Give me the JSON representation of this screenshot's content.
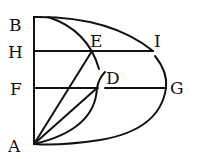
{
  "diagram": {
    "labels": {
      "B": "B",
      "H": "H",
      "F": "F",
      "A": "A",
      "E": "E",
      "D": "D",
      "I": "I",
      "G": "G"
    },
    "ink_color": "#111111",
    "background": "#ffffff"
  }
}
